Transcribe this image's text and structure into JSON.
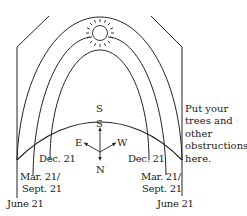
{
  "diagram": {
    "title": "",
    "compass": {
      "south_top": "S",
      "south_arrow": "S",
      "east": "E",
      "west": "W",
      "north": "N"
    },
    "paths": [
      {
        "name": "summer-solstice-path",
        "label": "June 21"
      },
      {
        "name": "equinox-path",
        "label_line1": "Mar. 21/",
        "label_line2": "Sept. 21"
      },
      {
        "name": "winter-solstice-path",
        "label": "Dec. 21"
      }
    ],
    "labels": {
      "dec_left": "Dec. 21",
      "dec_right": "Dec. 21",
      "mar_left": "Mar. 21/",
      "sept_left": "Sept. 21",
      "mar_right": "Mar. 21/",
      "sept_right": "Sept. 21",
      "june_left": "June 21",
      "june_right": "June 21"
    },
    "note": {
      "line1": "Put your",
      "line2": "trees and",
      "line3": "other",
      "line4": "obstructions",
      "line5": "here."
    },
    "sun_icon": "sun-icon"
  }
}
